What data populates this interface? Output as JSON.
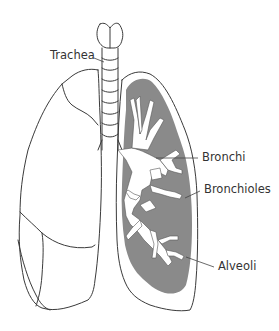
{
  "diagram": {
    "labels": {
      "trachea": "Trachea",
      "bronchi": "Bronchi",
      "bronchioles": "Bronchioles",
      "alveoli": "Alveoli"
    },
    "colors": {
      "outline": "#3a3a3a",
      "alveoli_fill": "#8a8a8a",
      "airway_fill": "#ffffff",
      "background": "#ffffff",
      "label_text": "#333333"
    }
  }
}
